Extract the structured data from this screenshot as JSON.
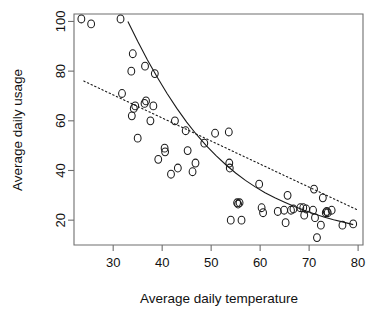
{
  "chart_data": {
    "type": "scatter",
    "title": "",
    "xlabel": "Average daily temperature",
    "ylabel": "Average daily usage",
    "xlim": [
      22,
      81
    ],
    "ylim": [
      10,
      103
    ],
    "xticks": [
      30,
      40,
      50,
      60,
      70,
      80
    ],
    "yticks": [
      20,
      40,
      60,
      80,
      100
    ],
    "xtick_labels": [
      "30",
      "40",
      "50",
      "60",
      "70",
      "80"
    ],
    "ytick_labels": [
      "20",
      "40",
      "60",
      "80",
      "100"
    ],
    "grid": false,
    "legend": null,
    "marker": "open-circle",
    "points": [
      [
        23.5,
        101
      ],
      [
        25.5,
        99
      ],
      [
        31.5,
        101
      ],
      [
        34.0,
        87
      ],
      [
        33.7,
        80
      ],
      [
        36.5,
        82
      ],
      [
        38.5,
        79
      ],
      [
        31.8,
        71
      ],
      [
        34.2,
        65
      ],
      [
        34.5,
        66
      ],
      [
        33.8,
        62
      ],
      [
        36.4,
        67
      ],
      [
        36.7,
        68
      ],
      [
        38.2,
        66
      ],
      [
        37.6,
        60
      ],
      [
        35.0,
        53
      ],
      [
        42.6,
        60
      ],
      [
        40.5,
        49
      ],
      [
        40.6,
        47.5
      ],
      [
        39.2,
        44.5
      ],
      [
        44.8,
        56
      ],
      [
        45.2,
        48
      ],
      [
        41.8,
        38.5
      ],
      [
        43.2,
        41
      ],
      [
        46.8,
        43
      ],
      [
        46.2,
        39.5
      ],
      [
        48.6,
        51
      ],
      [
        50.8,
        55
      ],
      [
        53.6,
        55.5
      ],
      [
        53.7,
        43
      ],
      [
        53.8,
        41
      ],
      [
        54.0,
        20
      ],
      [
        56.2,
        20
      ],
      [
        55.3,
        27
      ],
      [
        55.5,
        26.5
      ],
      [
        55.8,
        27
      ],
      [
        59.8,
        34.5
      ],
      [
        60.3,
        25
      ],
      [
        60.6,
        23
      ],
      [
        63.6,
        23.5
      ],
      [
        64.9,
        24
      ],
      [
        65.6,
        30
      ],
      [
        65.2,
        19
      ],
      [
        66.3,
        24
      ],
      [
        66.8,
        24.5
      ],
      [
        68.2,
        25
      ],
      [
        68.8,
        25
      ],
      [
        69.4,
        24.5
      ],
      [
        69.0,
        22
      ],
      [
        70.8,
        24
      ],
      [
        71.2,
        21
      ],
      [
        71.0,
        32.5
      ],
      [
        71.6,
        13
      ],
      [
        72.4,
        18
      ],
      [
        72.8,
        29
      ],
      [
        73.4,
        23
      ],
      [
        73.6,
        23.5
      ],
      [
        73.8,
        23
      ],
      [
        74.6,
        24
      ],
      [
        76.8,
        18
      ],
      [
        79.0,
        18.5
      ]
    ],
    "fits": [
      {
        "name": "exponential-fit",
        "style": "solid",
        "points": [
          [
            33.0,
            100.0
          ],
          [
            35.0,
            92.0
          ],
          [
            37.0,
            84.5
          ],
          [
            39.0,
            77.5
          ],
          [
            41.0,
            71.0
          ],
          [
            43.0,
            65.0
          ],
          [
            45.0,
            59.5
          ],
          [
            47.0,
            54.5
          ],
          [
            49.0,
            50.0
          ],
          [
            51.0,
            46.0
          ],
          [
            53.0,
            42.3
          ],
          [
            55.0,
            39.0
          ],
          [
            57.0,
            36.0
          ],
          [
            59.0,
            33.4
          ],
          [
            61.0,
            31.0
          ],
          [
            63.0,
            29.0
          ],
          [
            65.0,
            27.2
          ],
          [
            67.0,
            25.5
          ],
          [
            69.0,
            24.0
          ],
          [
            71.0,
            22.6
          ],
          [
            73.0,
            21.3
          ],
          [
            75.0,
            20.2
          ],
          [
            77.0,
            19.2
          ],
          [
            79.0,
            18.2
          ]
        ]
      },
      {
        "name": "linear-fit",
        "style": "dotted",
        "points": [
          [
            24.0,
            76.0
          ],
          [
            80.0,
            24.0
          ]
        ]
      }
    ]
  }
}
